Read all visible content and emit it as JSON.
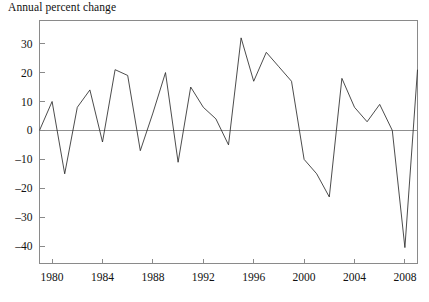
{
  "chart_data": {
    "type": "line",
    "title": "Annual percent change",
    "xlabel": "",
    "ylabel": "",
    "grid": false,
    "legend": null,
    "xlim": [
      1979,
      2009
    ],
    "ylim": [
      -46,
      38
    ],
    "yticks": [
      30,
      20,
      10,
      0,
      -10,
      -20,
      -30,
      -40
    ],
    "ytick_labels": [
      "30",
      "20",
      "10",
      "0",
      "–10",
      "–20",
      "–30",
      "–40"
    ],
    "xticks": [
      1980,
      1984,
      1988,
      1992,
      1996,
      2000,
      2004,
      2008
    ],
    "xtick_labels": [
      "1980",
      "1984",
      "1988",
      "1992",
      "1996",
      "2000",
      "2004",
      "2008"
    ],
    "x": [
      1979,
      1980,
      1981,
      1982,
      1983,
      1984,
      1985,
      1986,
      1987,
      1988,
      1989,
      1990,
      1991,
      1992,
      1993,
      1994,
      1995,
      1996,
      1997,
      1998,
      1999,
      2000,
      2001,
      2002,
      2003,
      2004,
      2005,
      2006,
      2007,
      2008,
      2009
    ],
    "values": [
      0,
      10,
      -15,
      8,
      14,
      -4,
      21,
      19,
      -7,
      6,
      20,
      -11,
      15,
      8,
      4,
      -5,
      32,
      17,
      27,
      22,
      17,
      -10,
      -15,
      -23,
      18,
      8,
      3,
      9,
      0,
      -40.5,
      21
    ],
    "series": [
      {
        "name": "Annual percent change",
        "color": "#2c2c2c",
        "values": [
          0,
          10,
          -15,
          8,
          14,
          -4,
          21,
          19,
          -7,
          6,
          20,
          -11,
          15,
          8,
          4,
          -5,
          32,
          17,
          27,
          22,
          17,
          -10,
          -15,
          -23,
          18,
          8,
          3,
          9,
          0,
          -40.5,
          21
        ]
      }
    ],
    "zero_reference_line": 0,
    "colors": {
      "line": "#2c2c2c",
      "axis": "#8a8a8a",
      "zero": "#8f8f8f",
      "text": "#111111",
      "background": "#ffffff"
    }
  }
}
